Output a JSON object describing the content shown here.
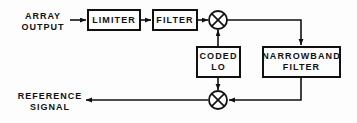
{
  "diagram": {
    "type": "signal-processing-block-diagram",
    "canvas": {
      "width": 357,
      "height": 123
    },
    "colors": {
      "ink": "#111111",
      "background": "#fdfdfd"
    },
    "labels": {
      "array_output": "ARRAY\nOUTPUT",
      "reference_signal": "REFERENCE\nSIGNAL"
    },
    "blocks": {
      "limiter": {
        "label": "LIMITER",
        "x": 87,
        "y": 9,
        "w": 54,
        "h": 22
      },
      "filter": {
        "label": "FILTER",
        "x": 152,
        "y": 9,
        "w": 46,
        "h": 22
      },
      "coded_lo": {
        "label": "CODED\nLO",
        "x": 196,
        "y": 46,
        "w": 45,
        "h": 32
      },
      "narrowband_filter": {
        "label": "NARROWBAND\nFILTER",
        "x": 262,
        "y": 46,
        "w": 79,
        "h": 32
      }
    },
    "mixers": [
      {
        "name": "upper-mixer",
        "symbol": "circle-with-x",
        "cx": 218,
        "cy": 20,
        "r": 9
      },
      {
        "name": "lower-mixer",
        "symbol": "circle-with-x",
        "cx": 218,
        "cy": 100,
        "r": 9
      }
    ],
    "signal_flow": [
      "ARRAY OUTPUT -> LIMITER",
      "LIMITER -> FILTER",
      "FILTER -> upper-mixer",
      "CODED LO -> upper-mixer",
      "upper-mixer -> NARROWBAND FILTER",
      "NARROWBAND FILTER -> lower-mixer",
      "CODED LO -> lower-mixer",
      "lower-mixer -> REFERENCE SIGNAL"
    ]
  }
}
